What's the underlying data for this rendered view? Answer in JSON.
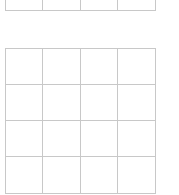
{
  "grids": [
    {
      "name": "grid-top",
      "rows_visible": 1,
      "cols": 4,
      "partially_cropped": true
    },
    {
      "name": "grid-bottom",
      "rows": 4,
      "cols": 4
    }
  ],
  "colors": {
    "line": "#c8c8c8",
    "background": "#ffffff"
  }
}
